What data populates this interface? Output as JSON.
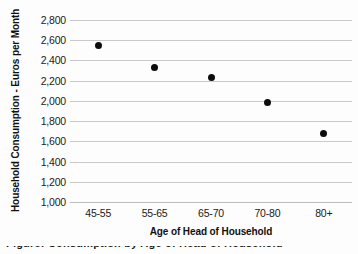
{
  "chart_data": {
    "type": "scatter",
    "title": "",
    "xlabel": "Age of Head of Household",
    "ylabel": "Household Consumption - Euros per Month",
    "categories": [
      "45-55",
      "55-65",
      "65-70",
      "70-80",
      "80+"
    ],
    "values": [
      2550,
      2330,
      2230,
      1980,
      1675
    ],
    "series": [
      {
        "name": "Household Consumption",
        "values": [
          2550,
          2330,
          2230,
          1980,
          1675
        ]
      }
    ],
    "ylim": [
      1000,
      2800
    ],
    "ytick_values": [
      2800,
      2600,
      2400,
      2200,
      2000,
      1800,
      1600,
      1400,
      1200,
      1000
    ],
    "ytick_labels": [
      "2,800",
      "2,600",
      "2,400",
      "2,200",
      "2,000",
      "1,800",
      "1,600",
      "1,400",
      "1,200",
      "1,000"
    ],
    "grid": true,
    "grid_axis": "y",
    "legend": false,
    "marker": "filled-circle",
    "marker_color": "#0d0d0d",
    "gridline_color": "#c9c9c9",
    "background_color": "#fdfdfd",
    "text_color": "#1a1a1a"
  },
  "axes": {
    "y_title": "Household Consumption - Euros per Month",
    "x_title": "Age of Head of Household"
  },
  "caption": {
    "text": "Figure: Consumption by Age of Head of Household"
  }
}
